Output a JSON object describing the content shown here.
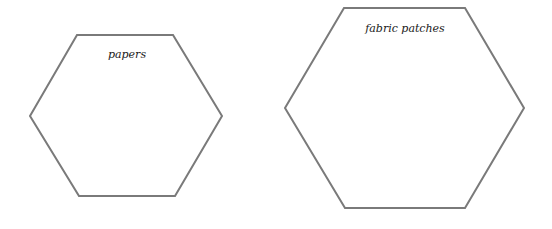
{
  "diagram": {
    "shapes": [
      {
        "type": "hexagon",
        "label": "papers"
      },
      {
        "type": "hexagon",
        "label": "fabric patches"
      }
    ],
    "stroke_color": "#7a7a7a"
  }
}
